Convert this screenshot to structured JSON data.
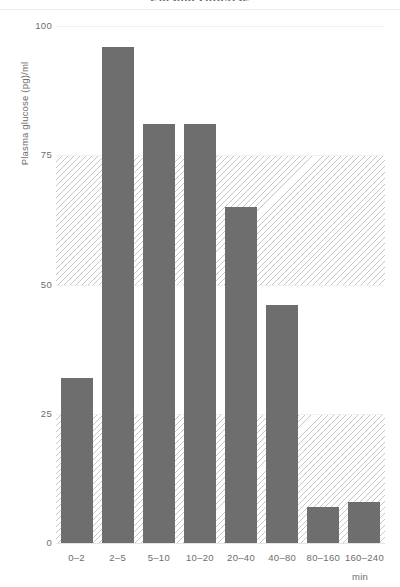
{
  "chart_data": {
    "type": "bar",
    "title": "Plasma Glucose",
    "xlabel": "min",
    "ylabel": "Plasma glucose (pg)/ml",
    "categories": [
      "0–2",
      "2–5",
      "5–10",
      "10–20",
      "20–40",
      "40–80",
      "80–160",
      "160–240"
    ],
    "values": [
      32,
      96,
      81,
      81,
      65,
      46,
      7,
      8
    ],
    "ylim": [
      0,
      100
    ],
    "yticks": [
      0,
      25,
      50,
      75,
      100
    ],
    "ytick_labels": [
      "0",
      "25",
      "50",
      "75",
      "100"
    ],
    "grid": true,
    "legend": null,
    "bands": [
      {
        "name": "upper-hatched-band",
        "from": 50,
        "to": 75
      },
      {
        "name": "lower-hatched-band",
        "from": 0,
        "to": 25
      }
    ],
    "colors": {
      "bar": "#6e6e6e",
      "grid": "#f0f1f3",
      "text": "#6d6d6d",
      "band_hatch": "#787878",
      "background": "#ffffff"
    }
  }
}
